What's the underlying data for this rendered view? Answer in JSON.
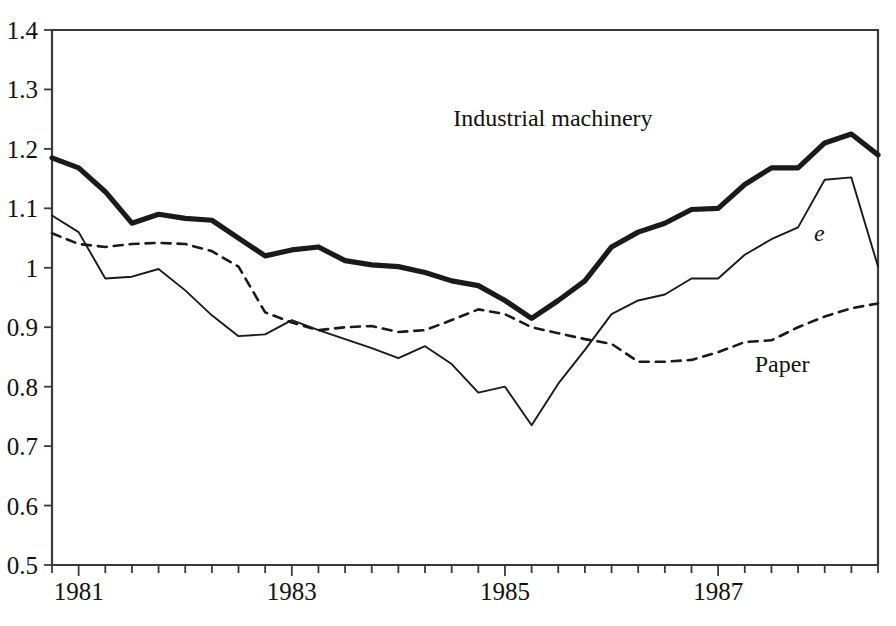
{
  "chart_data": {
    "type": "line",
    "title": "",
    "subtitle": "",
    "xlabel": "",
    "ylabel": "",
    "xlim": [
      1980.75,
      1988.5
    ],
    "ylim": [
      0.5,
      1.4
    ],
    "grid": false,
    "legend_position": "inline-annotations",
    "y_ticks": [
      "1.4",
      "1.3",
      "1.2",
      "1.1",
      "1",
      "0.9",
      "0.8",
      "0.7",
      "0.6",
      "0.5"
    ],
    "y_tick_values": [
      1.4,
      1.3,
      1.2,
      1.1,
      1.0,
      0.9,
      0.8,
      0.7,
      0.6,
      0.5
    ],
    "x_ticks": [
      "1981",
      "1983",
      "1985",
      "1987"
    ],
    "x_tick_values": [
      1981,
      1983,
      1985,
      1987
    ],
    "x_minor_tick_step": 0.25,
    "x": [
      1980.75,
      1981.0,
      1981.25,
      1981.5,
      1981.75,
      1982.0,
      1982.25,
      1982.5,
      1982.75,
      1983.0,
      1983.25,
      1983.5,
      1983.75,
      1984.0,
      1984.25,
      1984.5,
      1984.75,
      1985.0,
      1985.25,
      1985.5,
      1985.75,
      1986.0,
      1986.25,
      1986.5,
      1986.75,
      1987.0,
      1987.25,
      1987.5,
      1987.75,
      1988.0,
      1988.25,
      1988.5
    ],
    "series": [
      {
        "name": "Industrial machinery",
        "style": "thick-solid",
        "color": "#1a1a1a",
        "label_text": "Industrial machinery",
        "values": [
          1.185,
          1.168,
          1.128,
          1.075,
          1.09,
          1.083,
          1.08,
          1.05,
          1.02,
          1.03,
          1.035,
          1.012,
          1.005,
          1.002,
          0.992,
          0.978,
          0.97,
          0.945,
          0.915,
          0.945,
          0.978,
          1.035,
          1.06,
          1.075,
          1.098,
          1.1,
          1.14,
          1.168,
          1.168,
          1.21,
          1.225,
          1.19
        ]
      },
      {
        "name": "e",
        "style": "thin-solid",
        "color": "#1a1a1a",
        "label_text": "e",
        "values": [
          1.088,
          1.06,
          0.982,
          0.985,
          0.998,
          0.962,
          0.92,
          0.885,
          0.888,
          0.912,
          0.895,
          0.88,
          0.865,
          0.848,
          0.868,
          0.838,
          0.79,
          0.8,
          0.735,
          0.805,
          0.862,
          0.922,
          0.945,
          0.955,
          0.982,
          0.982,
          1.022,
          1.048,
          1.068,
          1.148,
          1.152,
          1.002
        ]
      },
      {
        "name": "Paper",
        "style": "dashed",
        "color": "#1a1a1a",
        "label_text": "Paper",
        "values": [
          1.058,
          1.04,
          1.035,
          1.04,
          1.042,
          1.04,
          1.028,
          1.002,
          0.925,
          0.908,
          0.895,
          0.9,
          0.902,
          0.892,
          0.895,
          0.912,
          0.93,
          0.922,
          0.9,
          0.89,
          0.88,
          0.872,
          0.842,
          0.842,
          0.845,
          0.858,
          0.875,
          0.878,
          0.9,
          0.918,
          0.932,
          0.94
        ]
      }
    ],
    "annotations": [
      {
        "text": "Industrial machinery",
        "x": 1985.45,
        "y": 1.238,
        "series": "Industrial machinery"
      },
      {
        "text": "e",
        "x": 1987.95,
        "y": 1.045,
        "series": "e"
      },
      {
        "text": "Paper",
        "x": 1987.6,
        "y": 0.825,
        "series": "Paper"
      }
    ]
  },
  "colors": {
    "background": "#ffffff",
    "ink": "#1a1a1a",
    "axis": "#3a3a3a"
  }
}
